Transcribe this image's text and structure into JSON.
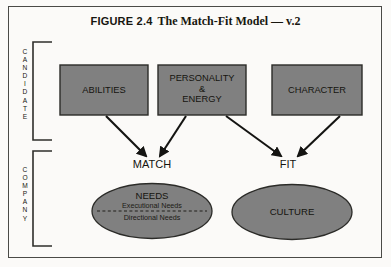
{
  "figure": {
    "number": "FIGURE 2.4",
    "name": "The Match-Fit Model — v.2"
  },
  "colors": {
    "frame_border": "#4a4a46",
    "page_background": "#fbfaf8",
    "shape_fill": "#808080",
    "shape_border": "#2b2b28",
    "arrow": "#141412",
    "text": "#15140f",
    "bracket": "#2f2f2b"
  },
  "groups": [
    {
      "id": "candidate",
      "label": "CANDIDATE",
      "letters": [
        "C",
        "A",
        "N",
        "D",
        "I",
        "D",
        "A",
        "T",
        "E"
      ]
    },
    {
      "id": "company",
      "label": "COMPANY",
      "letters": [
        "C",
        "O",
        "M",
        "P",
        "A",
        "N",
        "Y"
      ]
    }
  ],
  "boxes": [
    {
      "id": "abilities",
      "lines": [
        "ABILITIES"
      ]
    },
    {
      "id": "personality-energy",
      "lines": [
        "PERSONALITY",
        "&",
        "ENERGY"
      ]
    },
    {
      "id": "character",
      "lines": [
        "CHARACTER"
      ]
    }
  ],
  "nodes": [
    {
      "id": "match",
      "label": "MATCH"
    },
    {
      "id": "fit",
      "label": "FIT"
    }
  ],
  "ellipses": [
    {
      "id": "needs",
      "title": "NEEDS",
      "sub_top": "Executional Needs",
      "sub_bottom": "Directional Needs",
      "divider": "dashed"
    },
    {
      "id": "culture",
      "title": "CULTURE",
      "sub_top": "",
      "sub_bottom": "",
      "divider": "none"
    }
  ],
  "arrows": [
    {
      "id": "abilities-to-match",
      "from": "abilities",
      "to": "match"
    },
    {
      "id": "personality-to-match",
      "from": "personality-energy",
      "to": "match"
    },
    {
      "id": "personality-to-fit",
      "from": "personality-energy",
      "to": "fit"
    },
    {
      "id": "character-to-fit",
      "from": "character",
      "to": "fit"
    }
  ]
}
